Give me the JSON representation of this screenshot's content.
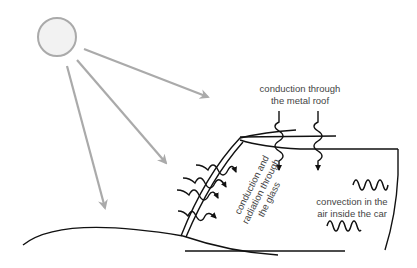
{
  "diagram": {
    "labels": {
      "roof_line1": "conduction through",
      "roof_line2": "the metal roof",
      "glass_line1": "conduction and",
      "glass_line2": "radiation through",
      "glass_line3": "the glass",
      "air_line1": "convection in the",
      "air_line2": "air inside the car"
    },
    "elements": {
      "sun": "sun-icon",
      "sun_rays": 3,
      "glass_wavy_arrows": 4,
      "roof_wavy_arrows": 2,
      "convection_waves": 2
    },
    "colors": {
      "sun_fill": "#f2f2f2",
      "sun_stroke": "#aaaaaa",
      "ray": "#aaaaaa",
      "line": "#111111",
      "text": "#444444"
    }
  }
}
